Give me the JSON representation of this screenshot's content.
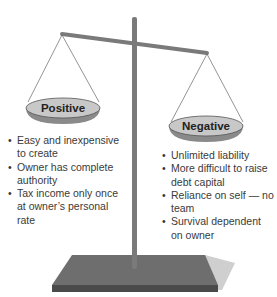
{
  "diagram": {
    "type": "balance-scale",
    "left_pan": {
      "label": "Positive",
      "items": [
        "Easy and inexpensive to create",
        "Owner has complete authority",
        "Tax income only once at owner’s personal rate"
      ]
    },
    "right_pan": {
      "label": "Negative",
      "items": [
        "Unlimited liability",
        "More difficult to raise debt capital",
        "Reliance on self — no team",
        "Survival dependent on owner"
      ]
    },
    "colors": {
      "pan_top": "#c8c8c8",
      "pan_bottom": "#8a8a8a",
      "post": "#7a7a7a",
      "base_top": "#6e6e6e",
      "base_side": "#4a4a4a",
      "shadow": "#cfcfcf"
    }
  }
}
